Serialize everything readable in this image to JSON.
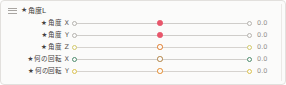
{
  "panel": {
    "header": {
      "grip_icon": "grip-handle-icon",
      "star_icon": "★",
      "title": "角度L"
    },
    "rows": [
      {
        "star_icon": "★",
        "label": "角度",
        "axis": "X",
        "value": "0.0",
        "left_handle_color": "#b6b3af",
        "mid_handle_color": "#e8566b",
        "mid_handle_style": "solid",
        "right_handle_color": "#b6b3af",
        "track_color": "#cfcdca",
        "left_pos_pct": 1,
        "mid_pos_pct": 49,
        "right_pos_pct": 99
      },
      {
        "star_icon": "★",
        "label": "角度",
        "axis": "Y",
        "value": "0.0",
        "left_handle_color": "#b6b3af",
        "mid_handle_color": "#e8566b",
        "mid_handle_style": "solid",
        "right_handle_color": "#b6b3af",
        "track_color": "#cfcdca",
        "left_pos_pct": 1,
        "mid_pos_pct": 49,
        "right_pos_pct": 99
      },
      {
        "star_icon": "★",
        "label": "角度",
        "axis": "Z",
        "value": "0.0",
        "left_handle_color": "#d2c96a",
        "mid_handle_color": "#e07b2a",
        "mid_handle_style": "ring",
        "right_handle_color": "#d2c96a",
        "track_color": "#d6d3cf",
        "left_pos_pct": 1,
        "mid_pos_pct": 49,
        "right_pos_pct": 99
      },
      {
        "star_icon": "★",
        "label": "何の回転",
        "axis": "X",
        "value": "0.0",
        "left_handle_color": "#4e8c6e",
        "mid_handle_color": "#b08142",
        "mid_handle_style": "ring",
        "right_handle_color": "#4e8c6e",
        "track_color": "#d1cfcb",
        "left_pos_pct": 1,
        "mid_pos_pct": 49,
        "right_pos_pct": 99
      },
      {
        "star_icon": "★",
        "label": "何の回転",
        "axis": "Y",
        "value": "0.0",
        "left_handle_color": "#dcc24e",
        "mid_handle_color": "#e58a2b",
        "mid_handle_style": "ring",
        "right_handle_color": "#dcc24e",
        "track_color": "#d6d3cf",
        "left_pos_pct": 1,
        "mid_pos_pct": 49,
        "right_pos_pct": 99
      }
    ]
  }
}
